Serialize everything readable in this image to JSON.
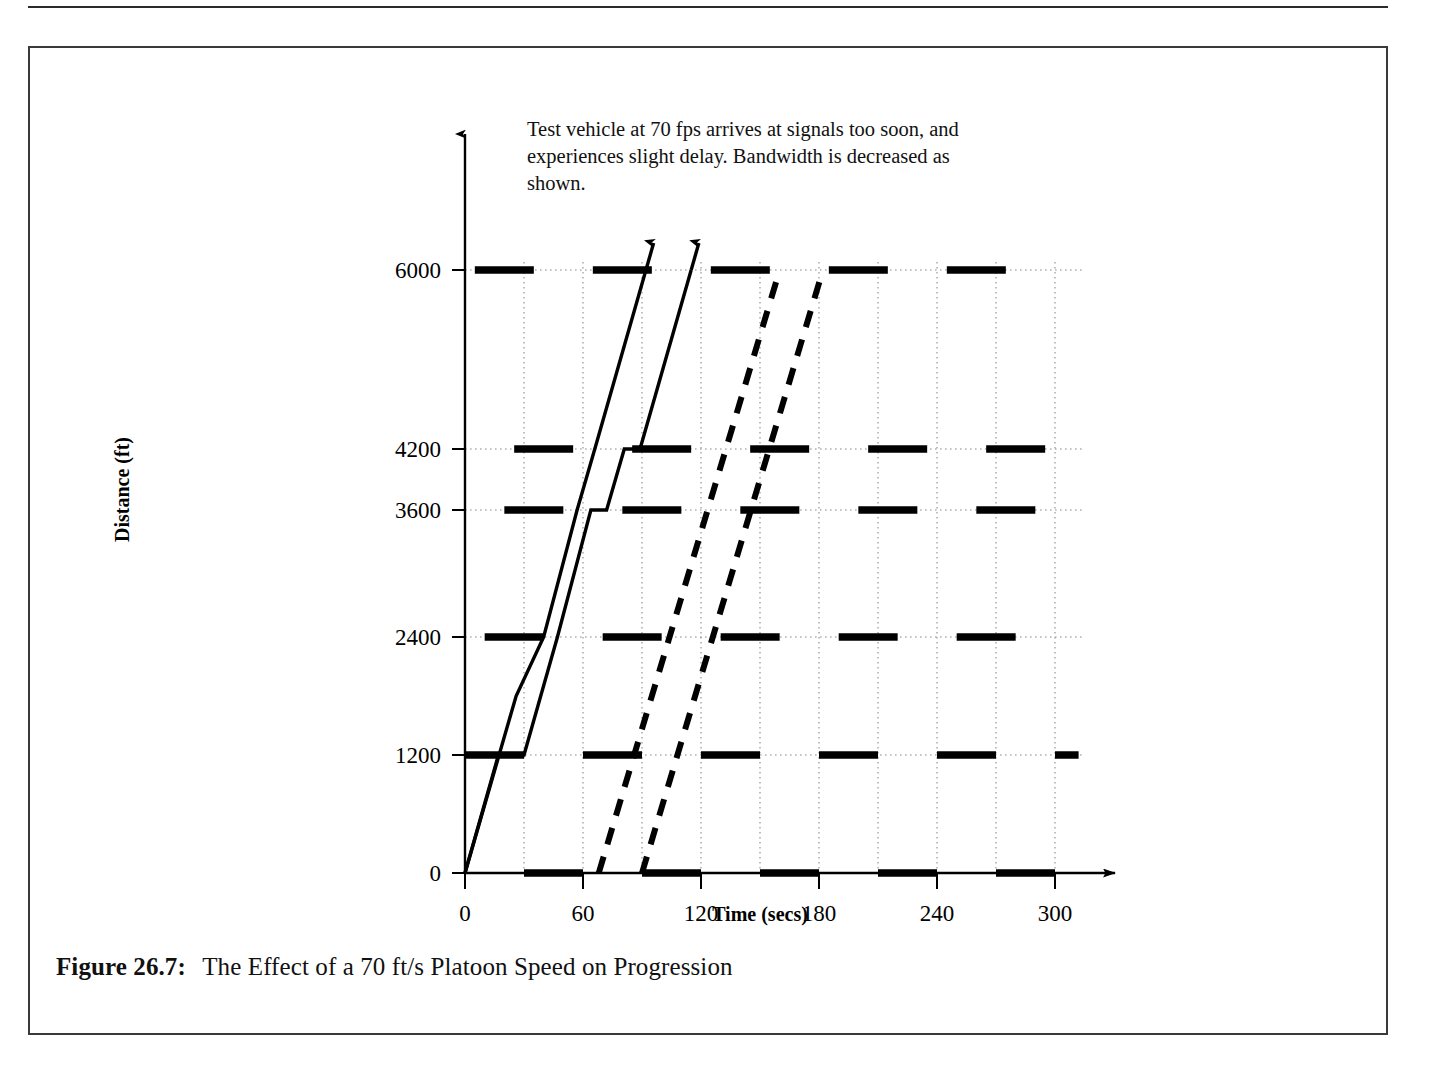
{
  "figure": {
    "caption_label": "Figure 26.7:",
    "caption_text": "The Effect of a 70 ft/s Platoon Speed on Progression",
    "annotation": "Test vehicle at 70 fps arrives at signals too soon, and experiences slight delay. Bandwidth is decreased as shown."
  },
  "chart_data": {
    "type": "line",
    "title": "",
    "xlabel": "Time (secs)",
    "ylabel": "Distance (ft)",
    "xlim": [
      0,
      330
    ],
    "ylim": [
      0,
      6600
    ],
    "xticks": [
      0,
      60,
      120,
      180,
      240,
      300
    ],
    "xticklabels": [
      "0",
      "60",
      "120",
      "180",
      "240",
      "300"
    ],
    "yticks": [
      0,
      1200,
      2400,
      3600,
      4200,
      6000
    ],
    "yticklabels": [
      "0",
      "1200",
      "2400",
      "3600",
      "4200",
      "6000"
    ],
    "gridlines_x": [
      30,
      60,
      90,
      120,
      150,
      180,
      210,
      240,
      270,
      300
    ],
    "grid": "dotted",
    "legend": "none",
    "signal_locations_ft": [
      0,
      1200,
      2400,
      3600,
      4200,
      6000
    ],
    "cycle_length_secs": 60,
    "red_bar_duration_secs": 30,
    "red_bars": [
      {
        "distance": 0,
        "offset": 30,
        "starts": [
          30,
          90,
          150,
          210,
          270
        ]
      },
      {
        "distance": 1200,
        "offset": 0,
        "starts": [
          0,
          60,
          120,
          180,
          240,
          300
        ]
      },
      {
        "distance": 2400,
        "offset": 10,
        "starts": [
          10,
          70,
          130,
          190,
          250
        ]
      },
      {
        "distance": 3600,
        "offset": 20,
        "starts": [
          20,
          80,
          140,
          200,
          260
        ]
      },
      {
        "distance": 4200,
        "offset": 25,
        "starts": [
          25,
          85,
          145,
          205,
          265
        ]
      },
      {
        "distance": 6000,
        "offset": 5,
        "starts": [
          5,
          65,
          125,
          185,
          245
        ]
      }
    ],
    "vehicle_trajectories": [
      {
        "name": "test-vehicle-leading",
        "speed_fps": 70,
        "style": "solid",
        "arrow": true,
        "points": [
          [
            0,
            0
          ],
          [
            17,
            1200
          ],
          [
            30,
            1200
          ],
          [
            47,
            2400
          ],
          [
            47,
            2400
          ],
          [
            64,
            3600
          ],
          [
            72,
            3600
          ],
          [
            81,
            4200
          ],
          [
            89,
            4200
          ],
          [
            115,
            6000
          ]
        ]
      },
      {
        "name": "test-vehicle-trailing",
        "speed_fps": 70,
        "style": "solid",
        "arrow": true,
        "points": [
          [
            0,
            0
          ],
          [
            26,
            1800
          ],
          [
            40,
            2400
          ],
          [
            57,
            3600
          ],
          [
            57,
            3600
          ],
          [
            66,
            4200
          ],
          [
            66,
            4200
          ],
          [
            92,
            6000
          ]
        ]
      }
    ],
    "bandwidth_lines": [
      {
        "name": "bandwidth-front",
        "style": "dashed",
        "points": [
          [
            68,
            0
          ],
          [
            160,
            6000
          ]
        ]
      },
      {
        "name": "bandwidth-rear",
        "style": "dashed",
        "points": [
          [
            90,
            0
          ],
          [
            182,
            6000
          ]
        ]
      }
    ]
  }
}
